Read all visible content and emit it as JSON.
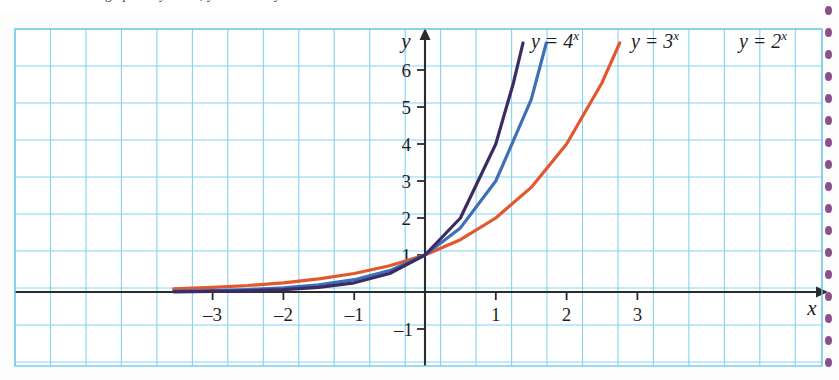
{
  "page": {
    "caption": "graphs of y = 2^x, y = 3^x and y = 4^x",
    "background_color": "#fdfdfd"
  },
  "binding": {
    "name": "spiral-binding-dots",
    "dot_color": "#8c4f8e",
    "dot_count": 17,
    "spacing": 22
  },
  "chart_data": {
    "type": "line",
    "title": "",
    "xlabel": "x",
    "ylabel": "y",
    "xlim": [
      -3.6,
      3.6
    ],
    "ylim": [
      -1.6,
      6.6
    ],
    "grid": true,
    "grid_color": "#7ed2ef",
    "axis_color": "#2b2b2b",
    "legend_position": "inline-top",
    "x_ticks": [
      -3,
      -2,
      -1,
      1,
      2,
      3
    ],
    "x_tick_labels": [
      "–3",
      "–2",
      "–1",
      "1",
      "2",
      "3"
    ],
    "y_ticks": [
      -1,
      1,
      2,
      3,
      4,
      5,
      6
    ],
    "y_tick_labels": [
      "–1",
      "1",
      "2",
      "3",
      "4",
      "5",
      "6"
    ],
    "series": [
      {
        "name": "y = 4^x",
        "label": "y = 4",
        "exponent": "x",
        "base": 4,
        "color": "#3b2a63",
        "x": [
          -3.55,
          -3.0,
          -2.5,
          -2.0,
          -1.5,
          -1.0,
          -0.5,
          0.0,
          0.5,
          1.0,
          1.25,
          1.45
        ],
        "y": [
          0.006,
          0.016,
          0.031,
          0.063,
          0.125,
          0.25,
          0.5,
          1.0,
          2.0,
          4.0,
          5.66,
          7.46
        ]
      },
      {
        "name": "y = 3^x",
        "label": "y = 3",
        "exponent": "x",
        "base": 3,
        "color": "#3f6fb5",
        "x": [
          -3.55,
          -3.0,
          -2.5,
          -2.0,
          -1.5,
          -1.0,
          -0.5,
          0.0,
          0.5,
          1.0,
          1.5,
          1.72
        ],
        "y": [
          0.021,
          0.037,
          0.064,
          0.111,
          0.192,
          0.333,
          0.577,
          1.0,
          1.732,
          3.0,
          5.196,
          6.77
        ]
      },
      {
        "name": "y = 2^x",
        "label": "y = 2",
        "exponent": "x",
        "base": 2,
        "color": "#e4572e",
        "x": [
          -3.55,
          -3.0,
          -2.5,
          -2.0,
          -1.5,
          -1.0,
          -0.5,
          0.0,
          0.5,
          1.0,
          1.5,
          2.0,
          2.5,
          2.75
        ],
        "y": [
          0.085,
          0.125,
          0.177,
          0.25,
          0.354,
          0.5,
          0.707,
          1.0,
          1.414,
          2.0,
          2.828,
          4.0,
          5.657,
          6.73
        ]
      }
    ],
    "annotations": [
      {
        "name": "label-4x",
        "text_main": "y = 4",
        "text_sup": "x",
        "x_px": 555,
        "y_px": 44,
        "color": "#1f1f1f"
      },
      {
        "name": "label-3x",
        "text_main": "y = 3",
        "text_sup": "x",
        "x_px": 655,
        "y_px": 44,
        "color": "#1f1f1f"
      },
      {
        "name": "label-2x",
        "text_main": "y = 2",
        "text_sup": "x",
        "x_px": 763,
        "y_px": 44,
        "color": "#1f1f1f"
      }
    ]
  }
}
